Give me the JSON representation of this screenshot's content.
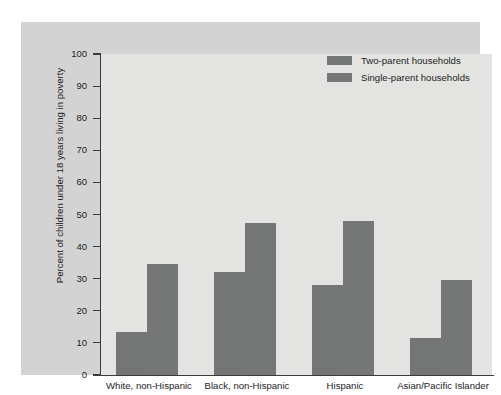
{
  "chart_data": {
    "type": "bar",
    "title": "",
    "subtitle": "",
    "xlabel": "",
    "ylabel": "Percent of children under 18 years living in poverty",
    "ylim": [
      0,
      100
    ],
    "ytick_step": 10,
    "yticks": [
      "100",
      "90",
      "80",
      "70",
      "60",
      "50",
      "40",
      "30",
      "20",
      "10",
      "0"
    ],
    "grid": false,
    "legend_position": "top-right",
    "categories": [
      "White, non-Hispanic",
      "Black, non-Hispanic",
      "Hispanic",
      "Asian/Pacific Islander"
    ],
    "series": [
      {
        "name": "Two-parent households",
        "color": "#747575",
        "values": [
          13.5,
          32.0,
          28.0,
          11.5
        ]
      },
      {
        "name": "Single-parent households",
        "color": "#757676",
        "values": [
          34.5,
          47.5,
          48.0,
          29.5
        ]
      }
    ],
    "colors": {
      "panel_background": "#d2d3d2",
      "plot_background": "#e3e4e2",
      "axis": "#3a3a3a",
      "text": "#1d1d1d",
      "bar": "#757575"
    }
  },
  "legend": {
    "items": [
      {
        "label": "Two-parent households"
      },
      {
        "label": "Single-parent households"
      }
    ]
  }
}
